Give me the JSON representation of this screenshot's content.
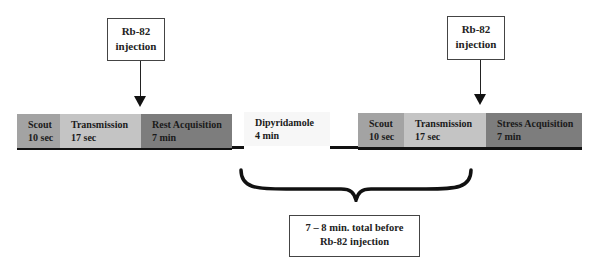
{
  "injections": [
    {
      "line1": "Rb-82",
      "line2": "injection"
    },
    {
      "line1": "Rb-82",
      "line2": "injection"
    }
  ],
  "segments": [
    {
      "name": "Scout",
      "duration": "10 sec",
      "color": "#a3a3a3"
    },
    {
      "name": "Transmission",
      "duration": "17 sec",
      "color": "#c4c4c4"
    },
    {
      "name": "Rest Acquisition",
      "duration": "7 min",
      "color": "#7d7d7d"
    },
    {
      "name": "Dipyridamole",
      "duration": "4 min",
      "color": "#f7f7f7"
    },
    {
      "name": "Scout",
      "duration": "10 sec",
      "color": "#a3a3a3"
    },
    {
      "name": "Transmission",
      "duration": "17 sec",
      "color": "#c4c4c4"
    },
    {
      "name": "Stress Acquisition",
      "duration": "7 min",
      "color": "#7d7d7d"
    }
  ],
  "note": {
    "line1": "7 – 8 min. total before",
    "line2": "Rb-82 injection"
  }
}
